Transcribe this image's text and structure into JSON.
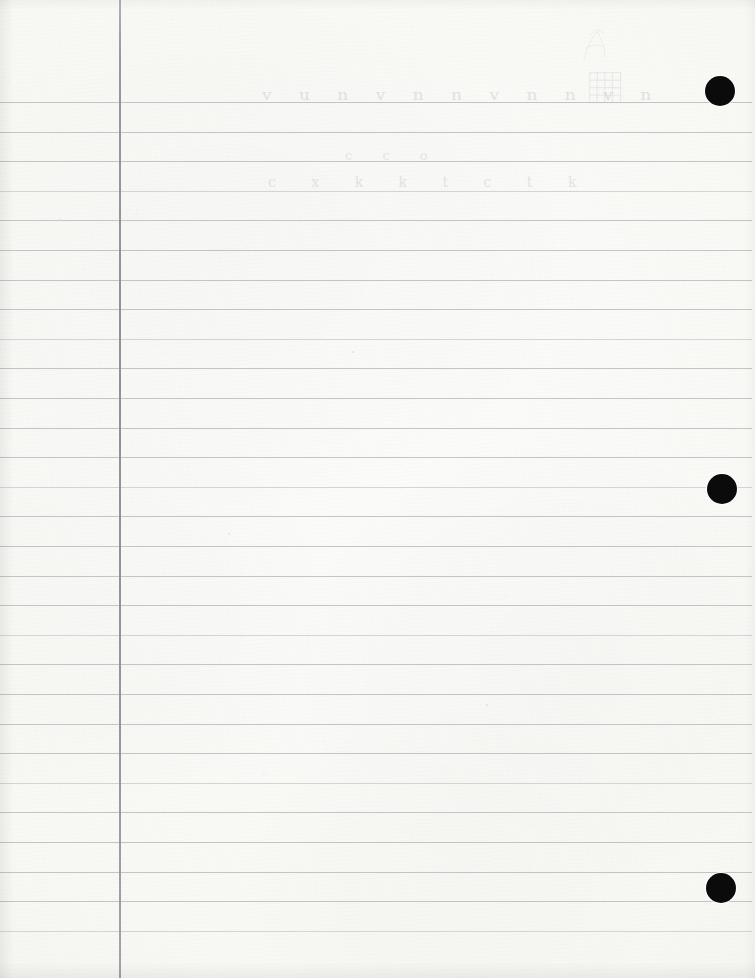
{
  "document": {
    "kind": "scanned-ruled-notebook-page",
    "title": "Blank ruled loose-leaf notebook page",
    "width": 755,
    "height": 978
  },
  "paper": {
    "background_color": "#f8f8f5",
    "rule_color": "#b9bcc0",
    "margin_rule_color": "#8b8d93",
    "hole_color": "#0b0b0b",
    "pencil_color": "#c9cbcd"
  },
  "ruling": {
    "first_line_y": 102,
    "line_spacing": 29.6,
    "line_count": 29,
    "line_left": 0,
    "line_right": 752,
    "margin_rule_x": 119
  },
  "holes": [
    {
      "name": "hole-top",
      "cx": 720,
      "cy": 91,
      "r": 15
    },
    {
      "name": "hole-middle",
      "cx": 722,
      "cy": 489,
      "r": 15
    },
    {
      "name": "hole-bottom",
      "cx": 721,
      "cy": 888,
      "r": 15
    }
  ],
  "handwriting": {
    "visible": true,
    "description": "faint erased pencil writing on the first ruled lines",
    "lines": [
      {
        "id": "line-1",
        "text": "v u  n v n  n v n   n v n",
        "x": 262,
        "y": 84
      },
      {
        "id": "line-2",
        "text": "c     c            o",
        "x": 345,
        "y": 148
      },
      {
        "id": "line-3",
        "text": "c x  k  k  t c  t k",
        "x": 268,
        "y": 174
      }
    ]
  },
  "sketch": {
    "grid": {
      "name": "grid-doodle",
      "x": 589,
      "y": 72,
      "width": 32,
      "height": 31,
      "columns": 4,
      "rows": 4
    },
    "scribble": {
      "name": "scribble-doodle",
      "x": 578,
      "y": 26,
      "width": 34,
      "height": 38
    }
  }
}
